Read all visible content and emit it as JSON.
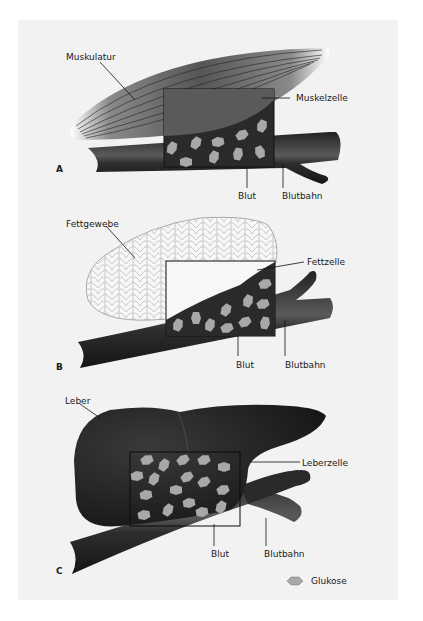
{
  "figure": {
    "panels": [
      {
        "id": "A",
        "letter": "A",
        "tissue_label": "Muskulatur",
        "cell_label": "Muskelzelle",
        "blood_label": "Blut",
        "vessel_label": "Blutbahn"
      },
      {
        "id": "B",
        "letter": "B",
        "tissue_label": "Fettgewebe",
        "cell_label": "Fettzelle",
        "blood_label": "Blut",
        "vessel_label": "Blutbahn"
      },
      {
        "id": "C",
        "letter": "C",
        "tissue_label": "Leber",
        "cell_label": "Leberzelle",
        "blood_label": "Blut",
        "vessel_label": "Blutbahn"
      }
    ],
    "legend": {
      "icon": "hexagon-icon",
      "label": "Glukose"
    },
    "colors": {
      "background": "#f2f2f2",
      "vessel": "#2a2a2a",
      "muscle": "#5a5a5a",
      "glucose": "#a8a8a8",
      "fat": "#f7f7f7",
      "liver": "#1e1e1e"
    }
  }
}
